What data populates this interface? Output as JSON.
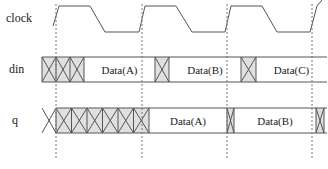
{
  "signals": [
    {
      "name": "clock",
      "label": "clock"
    },
    {
      "name": "din",
      "label": "din"
    },
    {
      "name": "q",
      "label": "q"
    }
  ],
  "din": {
    "segments": [
      {
        "type": "invalid",
        "x0": 42,
        "x1": 84,
        "crosses": 3
      },
      {
        "type": "data",
        "x0": 84,
        "x1": 155,
        "label": "Data(A)"
      },
      {
        "type": "invalid",
        "x0": 155,
        "x1": 169,
        "crosses": 1
      },
      {
        "type": "data",
        "x0": 169,
        "x1": 241,
        "label": "Data(B)"
      },
      {
        "type": "invalid",
        "x0": 241,
        "x1": 256,
        "crosses": 1
      },
      {
        "type": "data",
        "x0": 256,
        "x1": 327,
        "label": "Data(C)"
      }
    ]
  },
  "q": {
    "segments": [
      {
        "type": "invalid",
        "x0": 56,
        "x1": 149,
        "crosses": 6
      },
      {
        "type": "data",
        "x0": 149,
        "x1": 227,
        "label": "Data(A)"
      },
      {
        "type": "invalid",
        "x0": 227,
        "x1": 234,
        "crosses": 1
      },
      {
        "type": "data",
        "x0": 234,
        "x1": 316,
        "label": "Data(B)"
      },
      {
        "type": "invalid",
        "x0": 316,
        "x1": 324,
        "crosses": 1
      }
    ]
  },
  "clock_edges_x": [
    56,
    142,
    227,
    312
  ],
  "colors": {
    "line": "#555555",
    "hatch_fill": "#e0e0e0",
    "dash": "#777777"
  }
}
